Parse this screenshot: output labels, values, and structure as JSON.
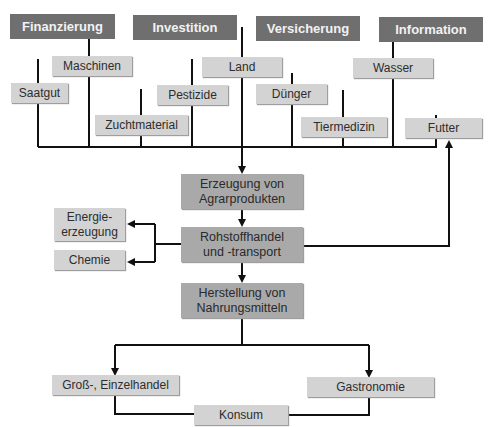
{
  "header_categories": [
    {
      "label": "Finanzierung"
    },
    {
      "label": "Investition"
    },
    {
      "label": "Versicherung"
    },
    {
      "label": "Information"
    }
  ],
  "inputs": {
    "saatgut": "Saatgut",
    "maschinen": "Maschinen",
    "zuchtmaterial": "Zuchtmaterial",
    "pestizide": "Pestizide",
    "land": "Land",
    "duenger": "Dünger",
    "tiermedizin": "Tiermedizin",
    "wasser": "Wasser",
    "futter": "Futter"
  },
  "chain": {
    "erzeugung": "Erzeugung von Agrarprodukten",
    "rohstoff_line1": "Rohstoffhandel",
    "rohstoff_line2": "und -transport",
    "herstellung": "Herstellung von Nahrungsmitteln"
  },
  "side_outputs": {
    "energie_line1": "Energie-",
    "energie_line2": "erzeugung",
    "chemie": "Chemie"
  },
  "distribution": {
    "handel": "Groß-, Einzelhandel",
    "gastronomie": "Gastronomie",
    "konsum": "Konsum"
  },
  "colors": {
    "header_bg": "#6f6f6f",
    "chain_bg": "#a9a9a9",
    "box_bg": "#d3d3d3",
    "line": "#111111"
  }
}
